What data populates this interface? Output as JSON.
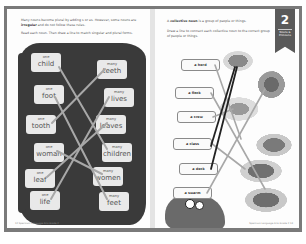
{
  "left_page": {
    "intro_line1": "Many nouns become plural by adding s or es. However, some nouns are",
    "intro_bold": "irregular",
    "intro_line2": " and do not follow these rules.",
    "instruction": "Read each noun. Then draw a line to match singular and plural forms.",
    "singular": [
      {
        "qty": "one",
        "word": "child"
      },
      {
        "qty": "one",
        "word": "foot"
      },
      {
        "qty": "one",
        "word": "tooth"
      },
      {
        "qty": "one",
        "word": "woman"
      },
      {
        "qty": "one",
        "word": "leaf"
      },
      {
        "qty": "one",
        "word": "life"
      }
    ],
    "plural": [
      {
        "qty": "many",
        "word": "teeth"
      },
      {
        "qty": "many",
        "word": "lives"
      },
      {
        "qty": "many",
        "word": "leaves"
      },
      {
        "qty": "many",
        "word": "children"
      },
      {
        "qty": "many",
        "word": "women"
      },
      {
        "qty": "many",
        "word": "feet"
      }
    ],
    "page_number": "12",
    "footer_text": "Spectrum Language Arts Grade 2"
  },
  "right_page": {
    "intro_bold": "collective noun",
    "intro_pre": "A ",
    "intro_post": " is a group of people or things.",
    "instruction": "Draw a line to connect each collective noun to the correct group of people or things.",
    "ribbon_number": "2",
    "ribbon_label": "Nouns & Pronouns",
    "labels": [
      "a herd",
      "a flock",
      "a crew",
      "a class",
      "a deck",
      "a swarm"
    ],
    "pictures": [
      "books",
      "birds",
      "sailors",
      "bees",
      "cards",
      "students"
    ],
    "page_number": "13",
    "footer_text": "Spectrum Language Arts Grade 2"
  },
  "colors": {
    "frame": "#7a7a7a",
    "blob": "#3a3a3a",
    "card": "#e9e9e9",
    "line_light": "#a8a8a8",
    "line_dark": "#222222",
    "ribbon": "#5a5a5a"
  }
}
